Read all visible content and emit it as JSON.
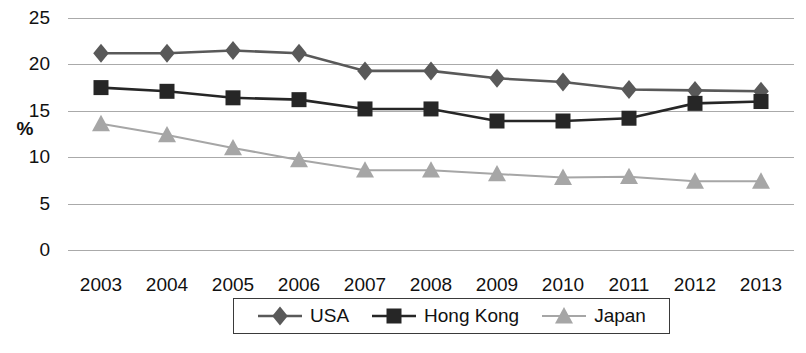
{
  "chart_data": {
    "type": "line",
    "title": "",
    "xlabel": "",
    "ylabel": "%",
    "categories": [
      "2003",
      "2004",
      "2005",
      "2006",
      "2007",
      "2008",
      "2009",
      "2010",
      "2011",
      "2012",
      "2013"
    ],
    "ylim": [
      0,
      25
    ],
    "yticks": [
      0,
      5,
      10,
      15,
      20,
      25
    ],
    "ytick_labels": [
      "0",
      "5",
      "10",
      "15",
      "20",
      "25"
    ],
    "grid": true,
    "legend_position": "bottom",
    "series": [
      {
        "name": "USA",
        "marker": "diamond",
        "color": "#595959",
        "values": [
          21.2,
          21.2,
          21.5,
          21.2,
          19.3,
          19.3,
          18.5,
          18.1,
          17.3,
          17.2,
          17.1
        ]
      },
      {
        "name": "Hong Kong",
        "marker": "square",
        "color": "#262626",
        "values": [
          17.5,
          17.1,
          16.4,
          16.2,
          15.2,
          15.2,
          13.9,
          13.9,
          14.2,
          15.8,
          16.0
        ]
      },
      {
        "name": "Japan",
        "marker": "triangle",
        "color": "#a6a6a6",
        "values": [
          13.6,
          12.4,
          11.0,
          9.7,
          8.6,
          8.6,
          8.2,
          7.8,
          7.9,
          7.4,
          7.4
        ]
      }
    ]
  },
  "legend": {
    "entries": [
      {
        "label": "USA"
      },
      {
        "label": "Hong Kong"
      },
      {
        "label": "Japan"
      }
    ]
  },
  "colors": {
    "usa": "#595959",
    "hong_kong": "#262626",
    "japan": "#a6a6a6",
    "gridline": "#aaaaaa",
    "text": "#111111",
    "background": "#ffffff"
  }
}
